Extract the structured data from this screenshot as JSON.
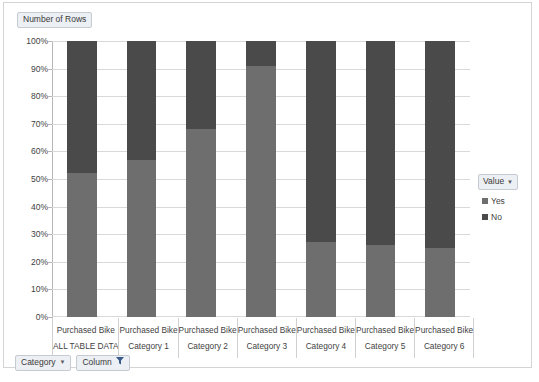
{
  "chart": {
    "title": "Number of Rows",
    "title_has_dropdown": false
  },
  "legend": {
    "title": "Value",
    "caret_icon": "chevron-down-icon",
    "entries": [
      {
        "label": "Yes",
        "color": "#6e6e6e"
      },
      {
        "label": "No",
        "color": "#4a4a4a"
      }
    ]
  },
  "toolbar": {
    "category_label": "Category",
    "category_caret_icon": "chevron-down-icon",
    "column_label": "Column",
    "column_filter_icon": "filter-icon"
  },
  "chart_data": {
    "type": "bar",
    "subtype": "stacked-100-percent",
    "title": "Number of Rows",
    "xlabel": "",
    "ylabel": "",
    "ylim": [
      0,
      100
    ],
    "ytick_labels": [
      "100%",
      "90%",
      "80%",
      "70%",
      "60%",
      "50%",
      "40%",
      "30%",
      "20%",
      "10%",
      "0%"
    ],
    "ytick_values": [
      100,
      90,
      80,
      70,
      60,
      50,
      40,
      30,
      20,
      10,
      0
    ],
    "grid": true,
    "legend_position": "right",
    "categories": [
      {
        "line1": "Purchased Bike",
        "line2": "ALL TABLE DATA"
      },
      {
        "line1": "Purchased Bike",
        "line2": "Category 1"
      },
      {
        "line1": "Purchased Bike",
        "line2": "Category 2"
      },
      {
        "line1": "Purchased Bike",
        "line2": "Category 3"
      },
      {
        "line1": "Purchased Bike",
        "line2": "Category 4"
      },
      {
        "line1": "Purchased Bike",
        "line2": "Category 5"
      },
      {
        "line1": "Purchased Bike",
        "line2": "Category 6"
      }
    ],
    "series": [
      {
        "name": "Yes",
        "color": "#6e6e6e",
        "values": [
          52,
          57,
          68,
          91,
          27,
          26,
          25
        ]
      },
      {
        "name": "No",
        "color": "#4a4a4a",
        "values": [
          48,
          43,
          32,
          9,
          73,
          74,
          75
        ]
      }
    ]
  }
}
